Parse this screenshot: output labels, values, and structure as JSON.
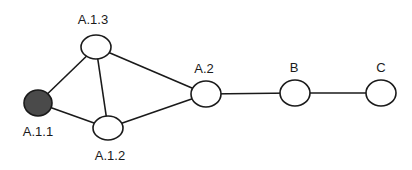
{
  "diagram": {
    "type": "graph",
    "nodes": [
      {
        "id": "A.1.1",
        "label": "A.1.1",
        "cx": 38,
        "cy": 103,
        "rx": 14,
        "ry": 13,
        "filled": true,
        "label_x": 38,
        "label_y": 136
      },
      {
        "id": "A.1.2",
        "label": "A.1.2",
        "cx": 108,
        "cy": 128,
        "rx": 15,
        "ry": 12,
        "filled": false,
        "label_x": 110,
        "label_y": 160
      },
      {
        "id": "A.1.3",
        "label": "A.1.3",
        "cx": 96,
        "cy": 47,
        "rx": 15,
        "ry": 12,
        "filled": false,
        "label_x": 93,
        "label_y": 24
      },
      {
        "id": "A.2",
        "label": "A.2",
        "cx": 206,
        "cy": 94,
        "rx": 15,
        "ry": 13,
        "filled": false,
        "label_x": 204,
        "label_y": 73
      },
      {
        "id": "B",
        "label": "B",
        "cx": 295,
        "cy": 93,
        "rx": 15,
        "ry": 13,
        "filled": false,
        "label_x": 294,
        "label_y": 72
      },
      {
        "id": "C",
        "label": "C",
        "cx": 381,
        "cy": 93,
        "rx": 15,
        "ry": 13,
        "filled": false,
        "label_x": 381,
        "label_y": 72
      }
    ],
    "edges": [
      {
        "from": "A.1.1",
        "to": "A.1.3"
      },
      {
        "from": "A.1.1",
        "to": "A.1.2"
      },
      {
        "from": "A.1.3",
        "to": "A.1.2"
      },
      {
        "from": "A.1.3",
        "to": "A.2"
      },
      {
        "from": "A.1.2",
        "to": "A.2"
      },
      {
        "from": "A.2",
        "to": "B"
      },
      {
        "from": "B",
        "to": "C"
      }
    ],
    "colors": {
      "stroke": "#1a1a1a",
      "filled_node": "#4a4a4a",
      "background": "#ffffff"
    }
  }
}
